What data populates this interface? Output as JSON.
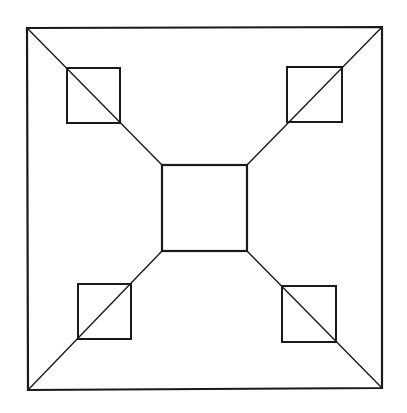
{
  "diagram": {
    "type": "geometric-figure",
    "stroke_color": "#1a1a1a",
    "background_color": "#ffffff",
    "outer_square": {
      "corners": {
        "top_left": [
          27,
          28
        ],
        "top_right": [
          382,
          27
        ],
        "bottom_right": [
          382,
          388
        ],
        "bottom_left": [
          28,
          390
        ]
      },
      "stroke_width": 2.2
    },
    "center_square": {
      "x": 162,
      "y": 165,
      "width": 85,
      "height": 86,
      "stroke_width": 2.2
    },
    "diagonals": [
      {
        "name": "top-left",
        "from": [
          27,
          28
        ],
        "to": [
          162,
          165
        ]
      },
      {
        "name": "top-right",
        "from": [
          382,
          27
        ],
        "to": [
          247,
          165
        ]
      },
      {
        "name": "bottom-left",
        "from": [
          28,
          390
        ],
        "to": [
          162,
          251
        ]
      },
      {
        "name": "bottom-right",
        "from": [
          382,
          388
        ],
        "to": [
          247,
          251
        ]
      }
    ],
    "corner_squares": [
      {
        "name": "top-left",
        "x": 67,
        "y": 68,
        "width": 53,
        "height": 55
      },
      {
        "name": "top-right",
        "x": 287,
        "y": 67,
        "width": 55,
        "height": 55
      },
      {
        "name": "bottom-left",
        "x": 78,
        "y": 284,
        "width": 53,
        "height": 55
      },
      {
        "name": "bottom-right",
        "x": 282,
        "y": 286,
        "width": 54,
        "height": 56
      }
    ],
    "diagonal_stroke_width": 1.4,
    "small_square_stroke_width": 2
  }
}
